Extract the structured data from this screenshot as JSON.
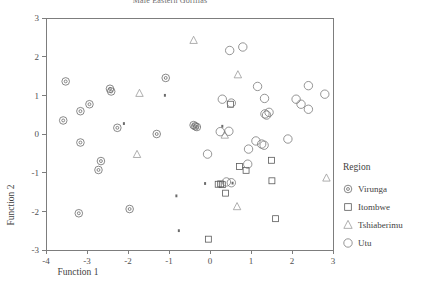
{
  "chart_data": {
    "type": "scatter",
    "title": "Male Eastern Gorillas",
    "xlabel": "Function 1",
    "ylabel": "Function 2",
    "xlim": [
      -4,
      3
    ],
    "ylim": [
      -3,
      3
    ],
    "xticks": [
      "-4",
      "-3",
      "-2",
      "-1",
      "0",
      "1",
      "2",
      "3"
    ],
    "yticks": [
      "-3",
      "-2",
      "-1",
      "0",
      "1",
      "2",
      "3"
    ],
    "xtick_values": [
      -4,
      -3,
      -2,
      -1,
      0,
      1,
      2,
      3
    ],
    "ytick_values": [
      -3,
      -2,
      -1,
      0,
      1,
      2,
      3
    ],
    "grid": false,
    "legend_title": "Region",
    "legend_position": "right",
    "series": [
      {
        "name": "Virunga",
        "marker": "circle-dot",
        "color": "#6b6b6b",
        "points": [
          [
            -3.52,
            1.36
          ],
          [
            -3.58,
            0.35
          ],
          [
            -3.16,
            0.59
          ],
          [
            -3.16,
            -0.22
          ],
          [
            -2.94,
            0.77
          ],
          [
            -2.66,
            -0.7
          ],
          [
            -2.72,
            -0.93
          ],
          [
            -2.44,
            1.17
          ],
          [
            -2.41,
            1.1
          ],
          [
            -2.26,
            0.16
          ],
          [
            -1.96,
            -1.94
          ],
          [
            -1.3,
            0.0
          ],
          [
            -1.08,
            1.45
          ],
          [
            -3.2,
            -2.05
          ],
          [
            -0.36,
            0.2
          ],
          [
            -0.32,
            0.18
          ],
          [
            -0.4,
            0.23
          ]
        ]
      },
      {
        "name": "Itombwe",
        "marker": "square",
        "color": "#5a5a5a",
        "points": [
          [
            0.5,
            0.77
          ],
          [
            0.72,
            -0.84
          ],
          [
            0.88,
            -0.94
          ],
          [
            0.2,
            -1.3
          ],
          [
            0.26,
            -1.29
          ],
          [
            0.3,
            -1.31
          ],
          [
            0.38,
            -1.53
          ],
          [
            1.5,
            -0.68
          ],
          [
            1.51,
            -1.21
          ],
          [
            1.6,
            -2.19
          ],
          [
            -0.04,
            -2.72
          ]
        ]
      },
      {
        "name": "Tshiaberimu",
        "marker": "triangle",
        "color": "#9a9a9a",
        "points": [
          [
            -0.4,
            2.42
          ],
          [
            0.68,
            1.53
          ],
          [
            -1.72,
            1.05
          ],
          [
            -1.78,
            -0.53
          ],
          [
            0.36,
            -0.03
          ],
          [
            0.66,
            -1.88
          ],
          [
            2.84,
            -1.14
          ]
        ]
      },
      {
        "name": "Utu",
        "marker": "circle",
        "color": "#7a7a7a",
        "points": [
          [
            0.48,
            2.16
          ],
          [
            0.8,
            2.25
          ],
          [
            1.16,
            1.23
          ],
          [
            2.4,
            1.25
          ],
          [
            2.8,
            1.03
          ],
          [
            2.1,
            0.9
          ],
          [
            2.22,
            0.77
          ],
          [
            2.4,
            0.64
          ],
          [
            1.33,
            0.92
          ],
          [
            1.38,
            0.49
          ],
          [
            1.34,
            0.52
          ],
          [
            1.44,
            0.56
          ],
          [
            0.52,
            0.8
          ],
          [
            0.3,
            0.9
          ],
          [
            0.25,
            0.06
          ],
          [
            0.46,
            0.07
          ],
          [
            1.12,
            -0.18
          ],
          [
            1.26,
            -0.26
          ],
          [
            1.32,
            -0.29
          ],
          [
            1.9,
            -0.13
          ],
          [
            0.94,
            -0.39
          ],
          [
            -0.06,
            -0.52
          ],
          [
            0.92,
            -0.78
          ],
          [
            0.4,
            -1.24
          ],
          [
            0.52,
            -1.26
          ]
        ]
      },
      {
        "name": "Unclassified",
        "marker": "dot",
        "color": "#4a4a4a",
        "points": [
          [
            -1.1,
            1.0
          ],
          [
            -2.1,
            0.27
          ],
          [
            -0.82,
            -1.6
          ],
          [
            -0.76,
            -2.5
          ],
          [
            -0.12,
            -1.28
          ],
          [
            0.55,
            -1.27
          ],
          [
            0.3,
            0.2
          ]
        ]
      }
    ]
  },
  "legend": {
    "title": "Region",
    "entries": [
      {
        "label": "Virunga",
        "marker": "circle-dot"
      },
      {
        "label": "Itombwe",
        "marker": "square"
      },
      {
        "label": "Tshiaberimu",
        "marker": "triangle"
      },
      {
        "label": "Utu",
        "marker": "circle"
      }
    ]
  },
  "axes": {
    "x_title": "Function 1",
    "y_title": "Function 2"
  }
}
